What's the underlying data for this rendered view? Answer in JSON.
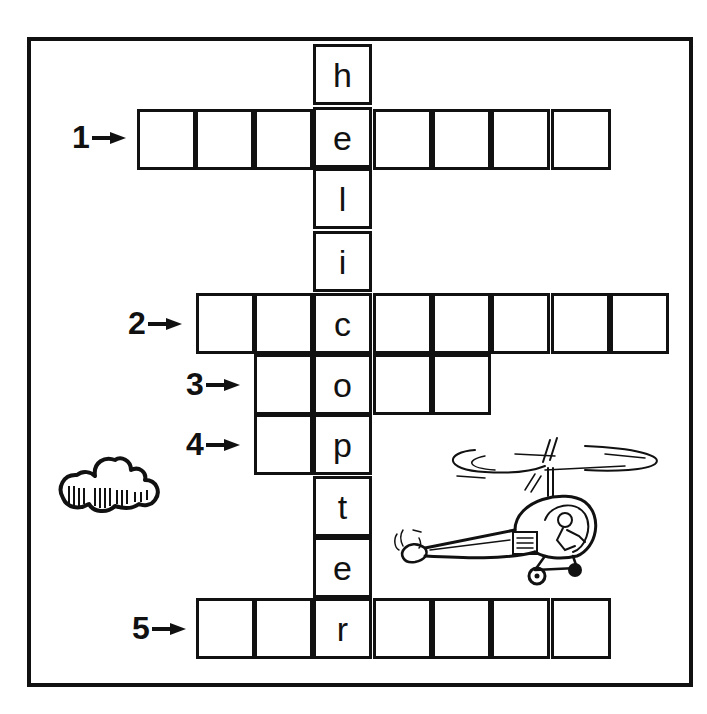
{
  "puzzle": {
    "type": "crossword",
    "vertical_word": "helicopter",
    "vertical_letters": [
      "h",
      "e",
      "l",
      "i",
      "c",
      "o",
      "p",
      "t",
      "e",
      "r"
    ],
    "rows": [
      {
        "number": "1",
        "length": 8,
        "intersect_index": 3,
        "letter": "e"
      },
      {
        "number": "2",
        "length": 8,
        "intersect_index": 2,
        "letter": "c"
      },
      {
        "number": "3",
        "length": 4,
        "intersect_index": 1,
        "letter": "o"
      },
      {
        "number": "4",
        "length": 2,
        "intersect_index": 1,
        "letter": "p"
      },
      {
        "number": "5",
        "length": 7,
        "intersect_index": 2,
        "letter": "r"
      }
    ],
    "labels": {
      "clue1": "1",
      "clue2": "2",
      "clue3": "3",
      "clue4": "4",
      "clue5": "5"
    },
    "letters": {
      "v0": "h",
      "v1": "e",
      "v2": "l",
      "v3": "i",
      "v4": "c",
      "v5": "o",
      "v6": "p",
      "v7": "t",
      "v8": "e",
      "v9": "r"
    }
  },
  "illustrations": {
    "cloud": "cloud-icon",
    "helicopter": "helicopter-icon"
  },
  "colors": {
    "ink": "#111111",
    "paper": "#ffffff"
  }
}
